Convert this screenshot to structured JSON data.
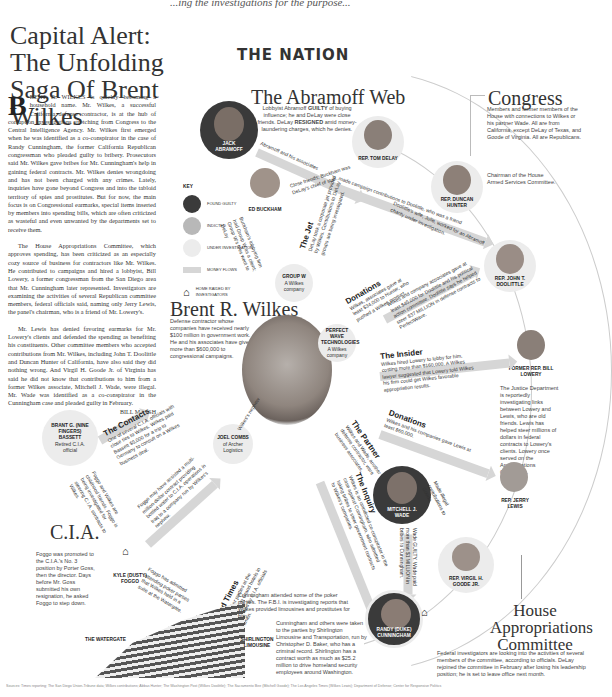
{
  "top_clip_text": "...ing the investigations for the purpose...",
  "headline": "Capital Alert: The Unfolding Saga Of Brent Wilkes",
  "section": "THE NATION",
  "article": {
    "dropcap": "B",
    "paragraphs": [
      "RENT R. WILKES is quickly becoming a household name. Mr. Wilkes, a successful California defense contractor, is at the hub of corruption investigations stretching from Congress to the Central Intelligence Agency. Mr. Wilkes first emerged when he was identified as a co-conspirator in the case of Randy Cunningham, the former California Republican congressman who pleaded guilty to bribery. Prosecutors said Mr. Wilkes gave bribes for Mr. Cunningham's help in gaining federal contracts. Mr. Wilkes denies wrongdoing and has not been charged with any crimes. Lately, inquiries have gone beyond Congress and into the tabloid territory of spies and prostitutes. But for now, the main focus is on Congressional earmarks, special items inserted by members into spending bills, which are often criticized as wasteful and even unwanted by the departments set to receive them.",
      "The House Appropriations Committee, which approves spending, has been criticized as an especially cozy source of business for contractors like Mr. Wilkes. He contributed to campaigns and hired a lobbyist, Bill Lowery, a former congressman from the San Diego area that Mr. Cunningham later represented. Investigators are examining the activities of several Republican committee members, federal officials said, naming only Jerry Lewis, the panel's chairman, who is a friend of Mr. Lowery's.",
      "Mr. Lewis has denied favoring earmarks for Mr. Lowery's clients and defended the spending as benefiting his constituents. Other committee members who accepted contributions from Mr. Wilkes, including John T. Doolittle and Duncan Hunter of California, have also said they did nothing wrong. And Virgil H. Goode Jr. of Virginia has said he did not know that contributions to him from a former Wilkes associate, Mitchell J. Wade, were illegal. Mr. Wade was identified as a co-conspirator in the Cunningham case and pleaded guilty in February."
    ],
    "byline": "BILL MARSH"
  },
  "abramoff": {
    "title": "The Abramoff Web",
    "desc_pre": "Lobbyist Abramoff ",
    "desc_guilty": "GUILTY",
    "desc_mid": " of buying influence; he and DeLay were close friends. DeLay ",
    "desc_resigned": "RESIGNED",
    "desc_post": " amid money-laundering charges, which he denies.",
    "jack": "JACK ABRAMOFF",
    "delay": "REP. TOM DELAY",
    "buckham": "ED BUCKHAM",
    "arrow1": "Abramoff and his associates",
    "arrow2": "made campaign contributions to Doolittle, who was a friend",
    "close_friends": "Close friends; Buckham was DeLay's chief of staff.",
    "buckham_note": "Buckham's lobbying firm had Group W as a client; Group W's fees went to DeLay",
    "jet": "The Jet",
    "jet_text": "DeLay took a corporate jet provided by Wilkes. Contributions to DeLay groups are being investigated.",
    "groupw": "GROUP W",
    "groupw_sub": "A Wilkes company"
  },
  "key": {
    "title": "KEY",
    "items": [
      {
        "label": "FOUND GUILTY",
        "color": "#3a3a3a"
      },
      {
        "label": "INDICTED",
        "color": "#b8b8b8"
      },
      {
        "label": "UNDER INVESTIGATION",
        "color": "#ececec"
      },
      {
        "label": "MONEY FLOWS",
        "color": "#d6d6d6"
      },
      {
        "label": "HOME RAIDED BY INVESTIGATORS",
        "color": "#222222"
      }
    ]
  },
  "congress": {
    "title": "Congress",
    "desc": "Members and former members of the House with connections to Wilkes or his partner Wade. All are from California, except DeLay of Texas, and Goode of Virginia. All are Republicans.",
    "hunter": "REP. DUNCAN HUNTER",
    "hunter_note": "Chairman of the House Armed Services Committee.",
    "doolittle": "REP. JOHN T. DOOLITTLE",
    "doolittle_note": "Doolittle's wife, Julie, worked for an Abramoff charity under investigation.",
    "lowery": "FORMER REP. BILL LOWERY",
    "lowery_note": "The Justice Department is reportedly investigating links between Lowery and Lewis, who are old friends. Lewis has helped steer millions of dollars in federal contracts to Lowery's clients. Lowery once served on the Appropriations Committee.",
    "lewis": "REP. JERRY LEWIS",
    "goode": "REP. VIRGIL H. GOODE JR.",
    "cunningham": "RANDY (DUKE) CUNNINGHAM"
  },
  "wilkes": {
    "title": "Brent R. Wilkes",
    "desc": "Defense contractor whose companies have received nearly $100 million in government work. He and his associates have given more than $600,000 to congressional campaigns.",
    "perfect_wave": "PERFECT WAVE TECHNOLOGIES",
    "perfect_wave_sub": "A Wilkes company",
    "combs": "JOEL COMBS",
    "combs_sub": "of Archer Logistics",
    "combs_note": "Wilkes's nephew"
  },
  "flows": {
    "donations1_title": "Donations",
    "donations1_text": "Wilkes, associates gave at least $34,000 to Hunter, who pushed a Wilkes product.",
    "doolittle_flow": "Wilkes and company associates gave at least $45,000 for Doolittle and his political action committee. Doolittle says he helped steer $37 MILLION in defense contracts to PerfectWave.",
    "insider_title": "The Insider",
    "insider_text": "Wilkes hired Lowery to lobby for him, costing more than $160,000. A Wilkes lawyer suggested that Lowery told Wilkes his firm could get Wilkes favorable appropriation results.",
    "donations2_title": "Donations",
    "donations2_text": "Wilkes and his companies gave Lewis at least $60,000.",
    "partner_title": "The Partner",
    "partner_text": "Wilkes and Wade, another defense contractor, were business associates.",
    "inquiry_title": "The Inquiry",
    "inquiry_text": "Wilkes is an unindicted co-conspirator in the case against Cunningham, who admitted taking bribes to steer government contracts to Wilkes's companies.",
    "wade_flow": "Wade GUILTY. Wade paid more than $1 MILLION in bribes to Cunningham.",
    "goode_flow": "Made illegal contributions to Goode",
    "contacts_title": "The Contacts",
    "contacts_text": "One of several C.I.A. officials with close ties to Wilkes. Wilkes paid Bassett $5,000 for a trip to Germany to consult on a Wilkes business deal.",
    "foggo1": "Foggo and Wilkes are childhood friends. Foggo is being investigated for steering C.I.A. contracts to Wilkes.",
    "foggo2": "Foggo may have assisted a multi-million-dollar contract providing bottled water to C.I.A. operations in Iraq to a company run by Wilkes's nephew.",
    "foggo3": "Foggo has admitted attending poker parties that Wilkes held in a suite at the Watergate.",
    "good_times_title": "The Good Times",
    "good_times_text": "Wilkes hosted poker parties at the Watergate and Westin Grand hotels in Washington attended by C.I.A. officials and congressmen.",
    "wade_name": "MITCHELL J. WADE"
  },
  "cia": {
    "title": "C.I.A.",
    "bassett": "BRANT G. (NINE FINGERS) BASSETT",
    "bassett_sub": "Retired C.I.A. official",
    "desc": "Foggo was promoted to the C.I.A.'s No. 3 position by Porter Goss, then the director. Days before Mr. Goss submitted his own resignation, he asked Foggo to step down.",
    "foggo": "KYLE (DUSTY) FOGGO"
  },
  "bottom": {
    "watergate": "THE WATERGATE",
    "shirlington": "SHIRLINGTON LIMOUSINE",
    "cunningham_note": "Cunningham attended some of the poker parties. The F.B.I. is investigating reports that Wilkes provided limousines and prostitutes for him.",
    "shirlington_note": "Cunningham and others were taken to the parties by Shirlington Limousine and Transportation, run by Christopher D. Baker, who has a criminal record. Shirlington has a contract worth as much as $25.2 million to drive homeland security employees around Washington."
  },
  "approps": {
    "title": "House Appropriations Committee",
    "desc": "Federal investigators are looking into the activities of several members of the committee, according to officials. DeLay rejoined the committee in February after losing his leadership position; he is set to leave office next month."
  },
  "source": "Sources: Times reporting; The San Diego Union-Tribune data; Wilkes contributions; Abbas Hunter; The Washington Post (Wilkes Doolittle); The Sacramento Bee (Mitchell Goode); The Los Angeles Times (Wilkes Lewis); Department of Defense; Center for Responsive Politics"
}
